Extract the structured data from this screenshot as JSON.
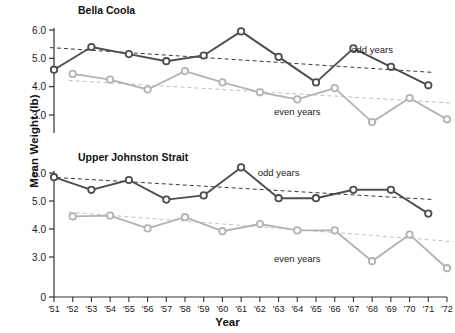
{
  "chart_data": [
    {
      "type": "line",
      "title": "Bella Coola",
      "xlabel": "Year",
      "ylabel": "Mean Weight (lb)",
      "grid": false,
      "legend_position": "inline-annotation",
      "xlim": [
        "'51",
        "'72"
      ],
      "ylim": [
        2.6,
        6.2
      ],
      "yticks": [
        3.0,
        4.0,
        5.0,
        6.0
      ],
      "ytick_labels": [
        "3.0",
        "4.0",
        "5.0",
        "6.0"
      ],
      "x": [
        "'51",
        "'52",
        "'53",
        "'54",
        "'55",
        "'56",
        "'57",
        "'58",
        "'59",
        "'60",
        "'61",
        "'62",
        "'63",
        "'64",
        "'65",
        "'66",
        "'67",
        "'68",
        "'69",
        "'70",
        "'71",
        "'72"
      ],
      "series": [
        {
          "name": "odd years",
          "color": "#4d4d4d",
          "x": [
            "'51",
            "'53",
            "'55",
            "'57",
            "'59",
            "'61",
            "'63",
            "'65",
            "'67",
            "'69",
            "'71"
          ],
          "values": [
            4.6,
            5.4,
            5.15,
            4.9,
            5.1,
            5.95,
            5.05,
            4.15,
            5.35,
            4.7,
            4.05
          ],
          "trend": {
            "start": 5.38,
            "end": 4.5,
            "style": "dashed"
          }
        },
        {
          "name": "even years",
          "color": "#b3b3b3",
          "x": [
            "'52",
            "'54",
            "'56",
            "'58",
            "'60",
            "'62",
            "'64",
            "'66",
            "'68",
            "'70",
            "'72"
          ],
          "values": [
            4.45,
            4.25,
            3.9,
            4.55,
            4.15,
            3.8,
            3.55,
            3.95,
            2.75,
            3.6,
            2.85
          ],
          "trend": {
            "start": 4.22,
            "end": 3.42,
            "style": "dashed"
          }
        }
      ],
      "annotations": [
        {
          "text": "odd years",
          "x": "'68",
          "y": 5.3
        },
        {
          "text": "even years",
          "x": "'64",
          "y": 3.12
        }
      ]
    },
    {
      "type": "line",
      "title": "Upper Johnston Strait",
      "xlabel": "Year",
      "ylabel": "Mean Weight (lb)",
      "grid": false,
      "legend_position": "inline-annotation",
      "xlim": [
        "'51",
        "'72"
      ],
      "ylim": [
        0,
        6.45
      ],
      "yticks": [
        0,
        3.0,
        4.0,
        5.0,
        6.0
      ],
      "ytick_labels": [
        "0",
        "3.0",
        "4.0",
        "5.0",
        "6.0"
      ],
      "x": [
        "'51",
        "'52",
        "'53",
        "'54",
        "'55",
        "'56",
        "'57",
        "'58",
        "'59",
        "'60",
        "'61",
        "'62",
        "'63",
        "'64",
        "'65",
        "'66",
        "'67",
        "'68",
        "'69",
        "'70",
        "'71",
        "'72"
      ],
      "series": [
        {
          "name": "odd years",
          "color": "#4d4d4d",
          "x": [
            "'51",
            "'53",
            "'55",
            "'57",
            "'59",
            "'61",
            "'63",
            "'65",
            "'67",
            "'69",
            "'71"
          ],
          "values": [
            5.85,
            5.4,
            5.75,
            5.05,
            5.2,
            6.2,
            5.1,
            5.1,
            5.4,
            5.4,
            4.55
          ],
          "trend": {
            "start": 5.85,
            "end": 5.05,
            "style": "dashed"
          }
        },
        {
          "name": "even years",
          "color": "#b3b3b3",
          "x": [
            "'52",
            "'54",
            "'56",
            "'58",
            "'60",
            "'62",
            "'64",
            "'66",
            "'68",
            "'70",
            "'72"
          ],
          "values": [
            4.45,
            4.48,
            4.02,
            4.42,
            3.92,
            4.18,
            3.95,
            3.95,
            2.85,
            3.8,
            2.6
          ],
          "trend": {
            "start": 4.6,
            "end": 3.55,
            "style": "dashed"
          }
        }
      ],
      "annotations": [
        {
          "text": "odd years",
          "x": "'63",
          "y": 6.02
        },
        {
          "text": "even years",
          "x": "'64",
          "y": 2.95
        }
      ]
    }
  ],
  "axis": {
    "ylabel": "Mean Weight (lb)",
    "xlabel": "Year",
    "xtick_labels": [
      "'51",
      "'52",
      "'53",
      "'54",
      "'55",
      "'56",
      "'57",
      "'58",
      "'59",
      "'60",
      "'61",
      "'62",
      "'63",
      "'64",
      "'65",
      "'66",
      "'67",
      "'68",
      "'69",
      "'70",
      "'71",
      "'72"
    ]
  },
  "panels": {
    "top_title": "Bella Coola",
    "bottom_title": "Upper Johnston Strait",
    "top_yticks": [
      "6.0",
      "5.0",
      "4.0",
      "3.0"
    ],
    "bottom_yticks": [
      "6.0",
      "5.0",
      "4.0",
      "3.0",
      "0"
    ],
    "odd_label": "odd years",
    "even_label": "even years"
  },
  "colors": {
    "odd_series": "#4d4d4d",
    "even_series": "#b3b3b3",
    "axis": "#333333",
    "text": "#111111"
  }
}
